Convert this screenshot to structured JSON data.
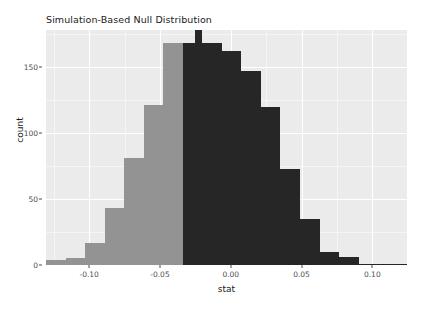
{
  "chart_data": {
    "type": "bar",
    "title": "Simulation-Based Null Distribution",
    "xlabel": "stat",
    "ylabel": "count",
    "xlim": [
      -0.1305,
      0.1245
    ],
    "ylim": [
      0,
      178
    ],
    "grid": true,
    "legend": null,
    "y_ticks": [
      0,
      50,
      100,
      150
    ],
    "y_tick_labels": [
      "0",
      "50",
      "100",
      "150"
    ],
    "y_minor_ticks": [
      25,
      75,
      125,
      175
    ],
    "x_ticks": [
      -0.1,
      -0.05,
      0.0,
      0.05,
      0.1
    ],
    "x_tick_labels": [
      "-0.10",
      "-0.05",
      "0.00",
      "0.05",
      "0.10"
    ],
    "x_minor_ticks": [
      -0.125,
      -0.075,
      -0.025,
      0.025,
      0.075,
      0.125
    ],
    "bin_width": 0.0138,
    "shade_split_x": -0.0205,
    "colors": {
      "bar_light": "#939393",
      "bar_dark": "#262626",
      "panel_background": "#ebebeb",
      "gridline": "#ffffff",
      "text": "#1a1a1a",
      "tick_text": "#4d4d4d"
    },
    "bars": [
      {
        "x0": -0.1305,
        "x1": -0.1167,
        "value": 4,
        "shade": "light"
      },
      {
        "x0": -0.1167,
        "x1": -0.1029,
        "value": 5,
        "shade": "light"
      },
      {
        "x0": -0.1029,
        "x1": -0.0891,
        "value": 17,
        "shade": "light"
      },
      {
        "x0": -0.0891,
        "x1": -0.0753,
        "value": 43,
        "shade": "light"
      },
      {
        "x0": -0.0753,
        "x1": -0.0615,
        "value": 81,
        "shade": "light"
      },
      {
        "x0": -0.0615,
        "x1": -0.0477,
        "value": 121,
        "shade": "light"
      },
      {
        "x0": -0.0477,
        "x1": -0.0339,
        "value": 168,
        "shade": "light"
      },
      {
        "x0": -0.0339,
        "x1": -0.0256,
        "value": 168,
        "shade": "dark"
      },
      {
        "x0": -0.0256,
        "x1": -0.0205,
        "value": 178,
        "shade": "dark"
      },
      {
        "x0": -0.0205,
        "x1": -0.0063,
        "value": 168,
        "shade": "dark"
      },
      {
        "x0": -0.0063,
        "x1": 0.0075,
        "value": 162,
        "shade": "dark"
      },
      {
        "x0": 0.0075,
        "x1": 0.0213,
        "value": 147,
        "shade": "dark"
      },
      {
        "x0": 0.0213,
        "x1": 0.0351,
        "value": 120,
        "shade": "dark"
      },
      {
        "x0": 0.0351,
        "x1": 0.0489,
        "value": 73,
        "shade": "dark"
      },
      {
        "x0": 0.0489,
        "x1": 0.0627,
        "value": 35,
        "shade": "dark"
      },
      {
        "x0": 0.0627,
        "x1": 0.0765,
        "value": 10,
        "shade": "dark"
      },
      {
        "x0": 0.0765,
        "x1": 0.0903,
        "value": 6,
        "shade": "dark"
      },
      {
        "x0": 0.0903,
        "x1": 0.1245,
        "value": 1,
        "shade": "dark"
      }
    ]
  }
}
